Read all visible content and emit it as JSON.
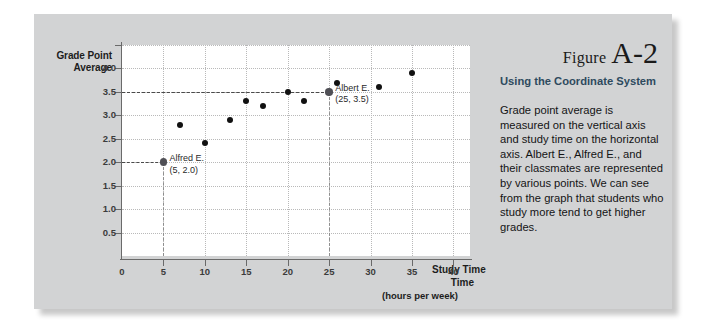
{
  "figure": {
    "label_word": "Figure",
    "number": "A-2",
    "heading": "Using the Coordinate System",
    "body": "Grade point average is measured on the vertical axis and study time on the horizontal axis. Albert E., Alfred E., and their classmates are represented by various points. We can see from the graph that students who study more tend to get higher grades."
  },
  "colors": {
    "panel_background": "#d2d3d4",
    "plot_background": "#ffffff",
    "axis": "#6a6a6a",
    "gridline": "#b9b9b9",
    "point": "#111111",
    "heading": "#2e4a5e"
  },
  "chart_data": {
    "type": "scatter",
    "title": "",
    "xlabel": "Study Time",
    "xlabel_line2": "Time",
    "xlabel_sub": "(hours per week)",
    "ylabel": "Grade Point Average",
    "xlim": [
      0,
      42
    ],
    "ylim": [
      0,
      4.5
    ],
    "grid": true,
    "legend": "none",
    "xticks": [
      0,
      5,
      10,
      15,
      20,
      25,
      30,
      35,
      40
    ],
    "xtick_labels": [
      "0",
      "5",
      "10",
      "15",
      "20",
      "25",
      "30",
      "35",
      "40"
    ],
    "yticks": [
      0.5,
      1.0,
      1.5,
      2.0,
      2.5,
      3.0,
      3.5,
      4.0,
      4.5
    ],
    "ytick_labels": [
      "0.5",
      "1.0",
      "1.5",
      "2.0",
      "2.5",
      "3.0",
      "3.5",
      "4.0",
      ""
    ],
    "points": [
      {
        "x": 5,
        "y": 2.0,
        "name": "Alfred E.",
        "highlight": true
      },
      {
        "x": 7,
        "y": 2.8,
        "name": "",
        "highlight": false
      },
      {
        "x": 10,
        "y": 2.4,
        "name": "",
        "highlight": false
      },
      {
        "x": 13,
        "y": 2.9,
        "name": "",
        "highlight": false
      },
      {
        "x": 15,
        "y": 3.3,
        "name": "",
        "highlight": false
      },
      {
        "x": 17,
        "y": 3.2,
        "name": "",
        "highlight": false
      },
      {
        "x": 20,
        "y": 3.5,
        "name": "",
        "highlight": false
      },
      {
        "x": 22,
        "y": 3.3,
        "name": "",
        "highlight": false
      },
      {
        "x": 25,
        "y": 3.5,
        "name": "Albert E.",
        "highlight": true
      },
      {
        "x": 26,
        "y": 3.7,
        "name": "",
        "highlight": false
      },
      {
        "x": 31,
        "y": 3.6,
        "name": "",
        "highlight": false
      },
      {
        "x": 35,
        "y": 3.9,
        "name": "",
        "highlight": false
      }
    ],
    "annotations": [
      {
        "name": "Alfred E.",
        "coord_text": "(5, 2.0)",
        "x": 5,
        "y": 2.0
      },
      {
        "name": "Albert E.",
        "coord_text": "(25, 3.5)",
        "x": 25,
        "y": 3.5
      }
    ]
  }
}
